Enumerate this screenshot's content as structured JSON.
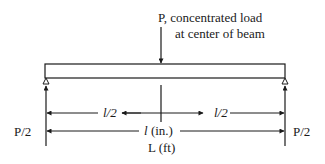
{
  "diagram": {
    "type": "simply-supported beam with center point load",
    "load": {
      "symbol": "P",
      "line1": "P, concentrated load",
      "line2": "at center of beam"
    },
    "reactions": {
      "left": "P/2",
      "right": "P/2"
    },
    "dimensions": {
      "half_left": "l/2",
      "half_right": "l/2",
      "span_symbol": "l",
      "span_unit": " (in.)",
      "span_ft": "L (ft)"
    },
    "colors": {
      "stroke": "#1a1a1a",
      "background": "#ffffff"
    }
  }
}
